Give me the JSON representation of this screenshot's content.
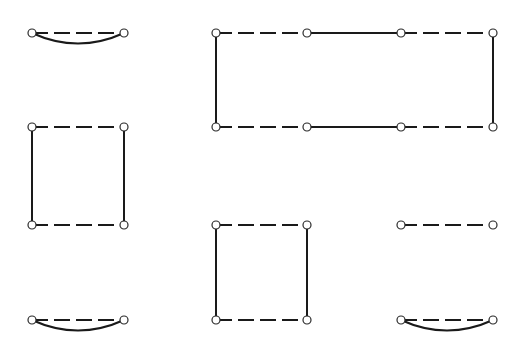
{
  "diagram": {
    "colors": {
      "edge": "#1a1a1a",
      "node_fill": "#ffffff",
      "background": "#ffffff"
    },
    "node_radius": 4,
    "components": [
      {
        "id": "lens-top-left",
        "nodes": [
          [
            32,
            33
          ],
          [
            124,
            33
          ]
        ],
        "edges": [
          {
            "from": 0,
            "to": 1,
            "style": "dashed",
            "shape": "straight"
          },
          {
            "from": 0,
            "to": 1,
            "style": "solid",
            "shape": "arc-down"
          }
        ]
      },
      {
        "id": "rect-large",
        "nodes": [
          [
            216,
            33
          ],
          [
            307,
            33
          ],
          [
            401,
            33
          ],
          [
            493,
            33
          ],
          [
            216,
            127
          ],
          [
            307,
            127
          ],
          [
            401,
            127
          ],
          [
            493,
            127
          ]
        ],
        "edges": [
          {
            "from": 0,
            "to": 1,
            "style": "dashed"
          },
          {
            "from": 1,
            "to": 2,
            "style": "solid"
          },
          {
            "from": 2,
            "to": 3,
            "style": "dashed"
          },
          {
            "from": 4,
            "to": 5,
            "style": "dashed"
          },
          {
            "from": 5,
            "to": 6,
            "style": "solid"
          },
          {
            "from": 6,
            "to": 7,
            "style": "dashed"
          },
          {
            "from": 0,
            "to": 4,
            "style": "solid"
          },
          {
            "from": 3,
            "to": 7,
            "style": "solid"
          }
        ]
      },
      {
        "id": "square-left",
        "nodes": [
          [
            32,
            127
          ],
          [
            124,
            127
          ],
          [
            32,
            225
          ],
          [
            124,
            225
          ]
        ],
        "edges": [
          {
            "from": 0,
            "to": 1,
            "style": "dashed"
          },
          {
            "from": 2,
            "to": 3,
            "style": "dashed"
          },
          {
            "from": 0,
            "to": 2,
            "style": "solid"
          },
          {
            "from": 1,
            "to": 3,
            "style": "solid"
          }
        ]
      },
      {
        "id": "square-middle",
        "nodes": [
          [
            216,
            225
          ],
          [
            307,
            225
          ],
          [
            216,
            320
          ],
          [
            307,
            320
          ]
        ],
        "edges": [
          {
            "from": 0,
            "to": 1,
            "style": "dashed"
          },
          {
            "from": 2,
            "to": 3,
            "style": "dashed"
          },
          {
            "from": 0,
            "to": 2,
            "style": "solid"
          },
          {
            "from": 1,
            "to": 3,
            "style": "solid"
          }
        ]
      },
      {
        "id": "segment-right",
        "nodes": [
          [
            401,
            225
          ],
          [
            493,
            225
          ]
        ],
        "edges": [
          {
            "from": 0,
            "to": 1,
            "style": "dashed",
            "shape": "straight"
          }
        ]
      },
      {
        "id": "lens-bottom-left",
        "nodes": [
          [
            32,
            320
          ],
          [
            124,
            320
          ]
        ],
        "edges": [
          {
            "from": 0,
            "to": 1,
            "style": "dashed",
            "shape": "straight"
          },
          {
            "from": 0,
            "to": 1,
            "style": "solid",
            "shape": "arc-down"
          }
        ]
      },
      {
        "id": "lens-bottom-right",
        "nodes": [
          [
            401,
            320
          ],
          [
            493,
            320
          ]
        ],
        "edges": [
          {
            "from": 0,
            "to": 1,
            "style": "dashed",
            "shape": "straight"
          },
          {
            "from": 0,
            "to": 1,
            "style": "solid",
            "shape": "arc-down"
          }
        ]
      }
    ]
  }
}
